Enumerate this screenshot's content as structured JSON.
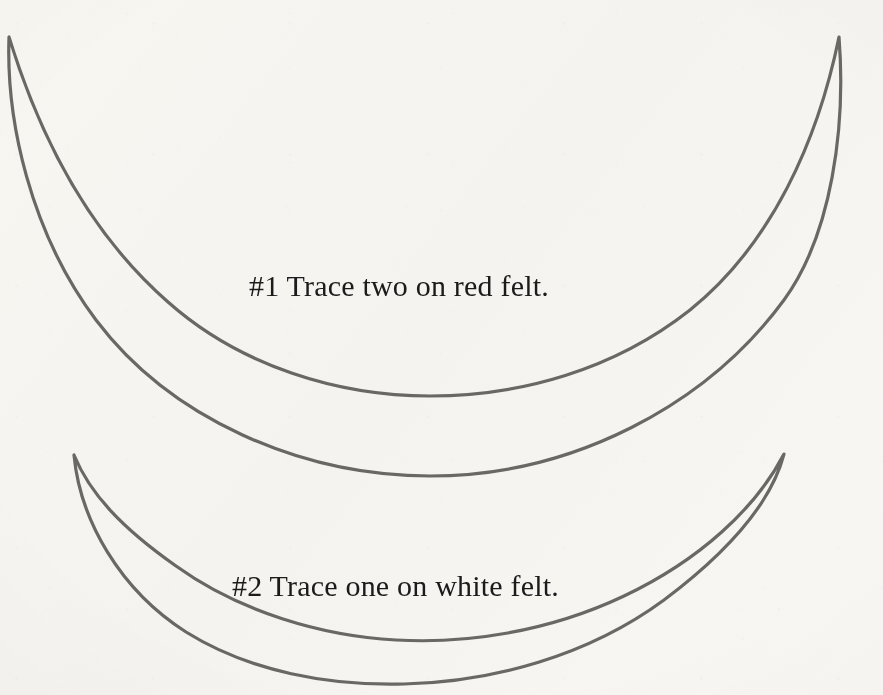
{
  "page": {
    "kind": "craft-pattern-template",
    "background_color": "#fbfaf8",
    "width": 883,
    "height": 695
  },
  "stroke": {
    "color": "#6b6a68",
    "width_px": 3.2,
    "style": "hand-traced-outline"
  },
  "shapes": [
    {
      "id": "crescent-large",
      "name": "large-crescent-outline",
      "label": "Large crescent pattern piece",
      "left_tip": [
        9,
        37
      ],
      "right_tip": [
        839,
        37
      ],
      "outer_lowest_y": 436,
      "inner_lowest_y": 207,
      "path": "M 9,37 C 6,120 30,232 96,320 C 170,418 300,476 430,476 C 572,476 706,406 784,300 C 832,234 846,126 839,37 C 818,140 772,244 690,310 C 614,370 520,396 430,396 C 338,396 240,366 168,302 C 88,232 40,138 9,37 Z"
    },
    {
      "id": "crescent-small",
      "name": "small-crescent-outline",
      "label": "Small crescent pattern piece",
      "left_tip": [
        74,
        455
      ],
      "right_tip": [
        784,
        454
      ],
      "outer_lowest_y": 666,
      "inner_lowest_y": 536,
      "path": "M 74,455 C 80,520 120,590 186,632 C 250,672 330,686 404,684 C 492,682 588,656 664,600 C 732,549 772,500 784,454 C 756,508 700,560 624,596 C 548,632 466,644 396,640 C 322,636 240,612 176,566 C 122,528 90,494 74,455 Z"
    }
  ],
  "captions": [
    {
      "id": "caption-1",
      "name": "instruction-caption-red-felt",
      "text": "#1 Trace two on red felt.",
      "color": "#1b1b1b",
      "font_size_px": 30
    },
    {
      "id": "caption-2",
      "name": "instruction-caption-white-felt",
      "text": "#2 Trace one on white felt.",
      "color": "#1b1b1b",
      "font_size_px": 30
    }
  ]
}
